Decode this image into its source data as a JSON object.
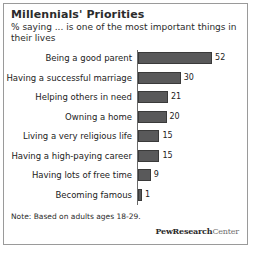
{
  "chart_data": {
    "type": "bar",
    "orientation": "horizontal",
    "title": "Millennials' Priorities",
    "subtitle": "% saying ... is one of the most important things in their lives",
    "categories": [
      "Being a good parent",
      "Having a successful marriage",
      "Helping others in need",
      "Owning a home",
      "Living a very religious life",
      "Having a high-paying career",
      "Having lots of free time",
      "Becoming famous"
    ],
    "values": [
      52,
      30,
      21,
      20,
      15,
      15,
      9,
      1
    ],
    "value_labels": [
      "52",
      "30",
      "21",
      "20",
      "15",
      "15",
      "9",
      "1"
    ],
    "xlabel": "",
    "ylabel": "",
    "xlim": [
      0,
      52
    ],
    "grid": false,
    "legend": false,
    "bar_color": "#59595a",
    "bar_border_color": "#3a3a3a",
    "axis_color": "#6b6b6b"
  },
  "note": "Note: Based on adults ages 18-29.",
  "logo": {
    "bold_part": "PewResearch",
    "light_part": "Center"
  }
}
